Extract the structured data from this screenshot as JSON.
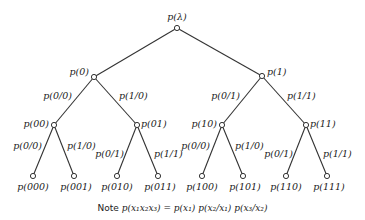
{
  "diagram": {
    "type": "binary-probability-tree",
    "root": {
      "label": "p(λ)"
    },
    "level1": [
      {
        "node": "p(0)",
        "edge": "p(0/0)"
      },
      {
        "node": "p(1)",
        "edge": ""
      }
    ],
    "nodes": {
      "root": "p(λ)",
      "n0": "p(0)",
      "n1": "p(1)",
      "n00": "p(00)",
      "n01": "p(01)",
      "n10": "p(10)",
      "n11": "p(11)",
      "n000": "p(000)",
      "n001": "p(001)",
      "n010": "p(010)",
      "n011": "p(011)",
      "n100": "p(100)",
      "n101": "p(101)",
      "n110": "p(110)",
      "n111": "p(111)"
    },
    "edges": {
      "n0_n00": "p(0/0)",
      "n0_n01": "p(1/0)",
      "n1_n10": "p(0/1)",
      "n1_n11": "p(1/1)",
      "n00_n000": "p(0/0)",
      "n00_n001": "p(1/0)",
      "n01_n010": "p(0/1)",
      "n01_n011": "p(1/1)",
      "n10_n100": "p(0/0)",
      "n10_n101": "p(1/0)",
      "n11_n110": "p(0/1)",
      "n11_n111": "p(1/1)"
    },
    "note": {
      "prefix": "Note ",
      "formula": "p(x₁x₂x₃) = p(x₁) p(x₂/x₁) p(x₃/x₂)"
    }
  }
}
